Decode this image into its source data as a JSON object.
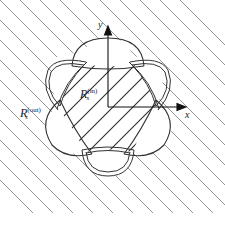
{
  "figure": {
    "labels": {
      "outer_region": {
        "base": "R",
        "sub": "s",
        "sup": "(out)"
      },
      "inner_region": {
        "base": "R",
        "sub": "s",
        "sup": "(in)"
      },
      "x_axis": "x",
      "y_axis": "y"
    },
    "colors": {
      "stroke": "#333333",
      "hatch_outer": "#8a8a8a",
      "hatch_inner": "#2a2a2a",
      "background": "#ffffff"
    },
    "shapes": {
      "single_line_lobes": [
        "top",
        "lower-left",
        "lower-right"
      ],
      "double_line_lobes": [
        "upper-left",
        "upper-right",
        "bottom"
      ],
      "hatched_regions": [
        "inner region R_s^(in)",
        "outer region R_s^(out)"
      ]
    }
  }
}
